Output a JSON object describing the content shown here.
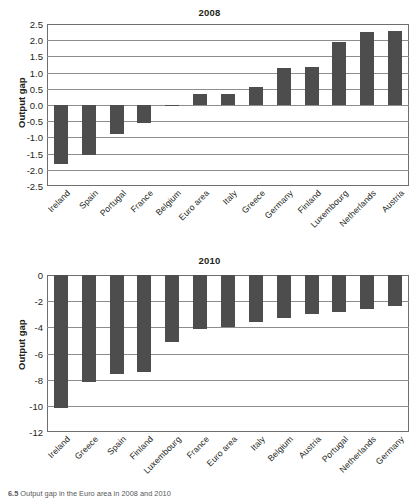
{
  "figure": {
    "background": "#ffffff",
    "bar_color": "#4d4d4d",
    "axis_color": "#6d6e71",
    "grid_color": "#8a8c8e"
  },
  "caption": {
    "number": "6.5",
    "text": "Output gap in the Euro area in 2008 and 2010"
  },
  "chart_data": [
    {
      "type": "bar",
      "title": "2008",
      "xlabel": "",
      "ylabel": "Output gap",
      "ylim": [
        -2.5,
        2.5
      ],
      "ytick_labels": [
        "2.5",
        "2.0",
        "1.5",
        "1.0",
        "0.5",
        "0.0",
        "-0.5",
        "-1.0",
        "-1.5",
        "-2.0",
        "-2.5"
      ],
      "yticks": [
        2.5,
        2.0,
        1.5,
        1.0,
        0.5,
        0.0,
        -0.5,
        -1.0,
        -1.5,
        -2.0,
        -2.5
      ],
      "grid": true,
      "legend": "none",
      "categories": [
        "Ireland",
        "Spain",
        "Portugal",
        "France",
        "Belgium",
        "Euro area",
        "Italy",
        "Greece",
        "Germany",
        "Finland",
        "Luxembourg",
        "Netherlands",
        "Austria"
      ],
      "values": [
        -1.83,
        -1.55,
        -0.89,
        -0.57,
        -0.03,
        0.33,
        0.33,
        0.55,
        1.13,
        1.17,
        1.95,
        2.25,
        2.29
      ]
    },
    {
      "type": "bar",
      "title": "2010",
      "xlabel": "",
      "ylabel": "Output gap",
      "ylim": [
        -12,
        0
      ],
      "ytick_labels": [
        "0",
        "-2",
        "-4",
        "-6",
        "-8",
        "-10",
        "-12"
      ],
      "yticks": [
        0,
        -2,
        -4,
        -6,
        -8,
        -10,
        -12
      ],
      "grid": true,
      "legend": "none",
      "categories": [
        "Ireland",
        "Greece",
        "Spain",
        "Finland",
        "Luxembourg",
        "France",
        "Euro area",
        "Italy",
        "Belgium",
        "Austria",
        "Portugal",
        "Netherlands",
        "Germany"
      ],
      "values": [
        -10.2,
        -8.2,
        -7.6,
        -7.4,
        -5.1,
        -4.1,
        -4.0,
        -3.6,
        -3.25,
        -3.0,
        -2.85,
        -2.6,
        -2.35
      ]
    }
  ]
}
